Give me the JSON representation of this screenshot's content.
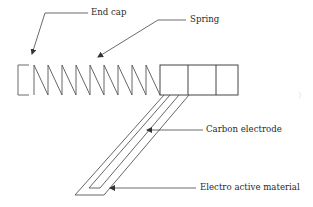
{
  "diagram": {
    "type": "schematic",
    "labels": {
      "end_cap": "End cap",
      "spring": "Spring",
      "carbon_electrode": "Carbon electrode",
      "electro_active_material": "Electro active material"
    },
    "colors": {
      "line": "#555555",
      "text": "#2a2a2a",
      "background": "#ffffff"
    },
    "components": [
      "end-cap",
      "spring",
      "housing-boxes",
      "carbon-electrode",
      "electro-active-material"
    ]
  }
}
